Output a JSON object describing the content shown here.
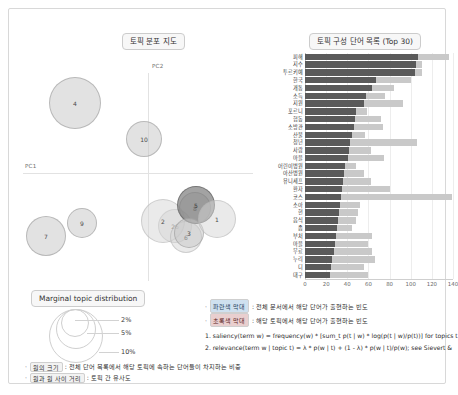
{
  "panels": {
    "map_title": "토픽 분포 지도",
    "bar_title": "토픽 구성 단어 목록 (Top 30)",
    "marginal_title": "Marginal topic distribution"
  },
  "map": {
    "axis_x_label": "PC1",
    "axis_y_label": "PC2",
    "bubbles": [
      {
        "label": "4",
        "x": 52,
        "y": 52,
        "r": 26,
        "shade": "light"
      },
      {
        "label": "10",
        "x": 121,
        "y": 88,
        "r": 18,
        "shade": "light"
      },
      {
        "label": "7",
        "x": 23,
        "y": 185,
        "r": 20,
        "shade": "light"
      },
      {
        "label": "9",
        "x": 59,
        "y": 172,
        "r": 15,
        "shade": "light"
      },
      {
        "label": "26",
        "x": 152,
        "y": 175,
        "r": 17,
        "shade": "pale"
      },
      {
        "label": "2",
        "x": 140,
        "y": 170,
        "r": 22,
        "shade": "pale"
      },
      {
        "label": "6",
        "x": 163,
        "y": 186,
        "r": 16,
        "shade": "pale"
      },
      {
        "label": "8",
        "x": 172,
        "y": 157,
        "r": 16,
        "shade": "light"
      },
      {
        "label": "5",
        "x": 173,
        "y": 154,
        "r": 19,
        "shade": "dark"
      },
      {
        "label": "3",
        "x": 166,
        "y": 182,
        "r": 15,
        "shade": "light"
      },
      {
        "label": "1",
        "x": 194,
        "y": 168,
        "r": 19,
        "shade": "pale"
      }
    ]
  },
  "marginal": {
    "labels": [
      "2%",
      "5%",
      "10%"
    ]
  },
  "notes": [
    {
      "tag": "원의 크기",
      "text": ": 전체 단어 목록에서 해당 토픽에 속하는 단어들이 차지하는 비중"
    },
    {
      "tag": "원과 원 사이 거리",
      "text": ": 토픽 간 유사도"
    }
  ],
  "legend": {
    "items": [
      {
        "swatch": "파란색 막대",
        "swatch_kind": "blue",
        "text": ": 전체 문서에서 해당 단어가 출현하는 빈도"
      },
      {
        "swatch": "초록색 막대",
        "swatch_kind": "red",
        "text": ": 해당 토픽에서 해당 단어가 출현하는 빈도"
      }
    ],
    "formulas": [
      "1. saliency(term w) = frequency(w) * [sum_t p(t | w) * log(p(t | w)/p(t))] for topics t",
      "2. relevance(term w | topic t) = λ * p(w | t) + (1 - λ) * p(w | t)/p(w); see Sievert &"
    ]
  },
  "chart_data": {
    "type": "bar",
    "title": "토픽 구성 단어 목록 (Top 30)",
    "orientation": "horizontal",
    "xlabel": "",
    "ylabel": "",
    "xlim": [
      0,
      140
    ],
    "xticks": [
      0,
      20,
      40,
      60,
      80,
      100,
      120,
      140
    ],
    "grid": true,
    "legend_position": "below",
    "categories": [
      "피해",
      "지수",
      "투르키예",
      "한국",
      "개통",
      "소득",
      "지원",
      "포르니",
      "협동",
      "소방관",
      "산불",
      "청년",
      "사람",
      "마을",
      "어린이병원",
      "아산병원",
      "유니세프",
      "환자",
      "코스",
      "소아",
      "현",
      "음식",
      "좀",
      "부처",
      "마을",
      "무료",
      "누리",
      "디",
      "대구"
    ],
    "series": [
      {
        "name": "전체 문서에서 해당 단어가 출현하는 빈도",
        "color": "#c9c9c9",
        "values": [
          136,
          111,
          111,
          100,
          84,
          76,
          93,
          59,
          72,
          74,
          57,
          106,
          62,
          75,
          48,
          56,
          62,
          80,
          139,
          52,
          50,
          48,
          44,
          63,
          60,
          63,
          66,
          56,
          60
        ]
      },
      {
        "name": "해당 토픽에서 해당 단어가 출현하는 빈도",
        "color": "#5a5a5a",
        "values": [
          107,
          105,
          104,
          67,
          63,
          58,
          56,
          48,
          47,
          46,
          44,
          43,
          42,
          41,
          38,
          37,
          36,
          35,
          34,
          33,
          32,
          31,
          30,
          29,
          28,
          27,
          26,
          25,
          24
        ]
      }
    ]
  }
}
